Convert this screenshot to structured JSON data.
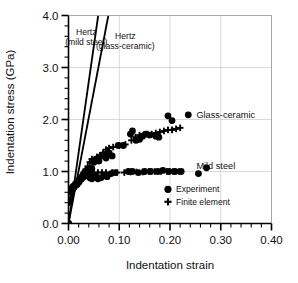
{
  "chart_data": {
    "type": "scatter",
    "title": "",
    "xlabel": "Indentation strain",
    "ylabel": "Indentation stress (GPa)",
    "xlim": [
      0.0,
      0.4
    ],
    "ylim": [
      0.0,
      4.0
    ],
    "xticks": [
      "0.00",
      "0.10",
      "0.20",
      "0.30",
      "0.40"
    ],
    "xtick_values": [
      0.0,
      0.1,
      0.2,
      0.3,
      0.4
    ],
    "yticks": [
      "0.0",
      "1.0",
      "2.0",
      "3.0",
      "4.0"
    ],
    "ytick_values": [
      0.0,
      1.0,
      2.0,
      3.0,
      4.0
    ],
    "x_minor_step": 0.02,
    "y_minor_step": 0.2,
    "grid": true,
    "grid_color": "#c8c8c8",
    "legend_position": "lower-right-inside",
    "legend": [
      {
        "marker": "circle",
        "label": "Experiment"
      },
      {
        "marker": "plus",
        "label": "Finite element"
      }
    ],
    "annotations": [
      {
        "name": "hertz-mild-steel",
        "lines": [
          "Hertz",
          "(mild steel)"
        ],
        "x": 0.035,
        "y": 3.62
      },
      {
        "name": "hertz-glass-ceramic",
        "lines": [
          "Hertz",
          "(glass-ceramic)"
        ],
        "x": 0.112,
        "y": 3.55
      },
      {
        "name": "glass-ceramic-label",
        "lines": [
          "Glass-ceramic"
        ],
        "x": 0.252,
        "y": 2.02
      },
      {
        "name": "mild-steel-label",
        "lines": [
          "Mild steel"
        ],
        "x": 0.252,
        "y": 1.05
      }
    ],
    "reference_lines": [
      {
        "name": "Hertz (mild steel)",
        "x": [
          0.0,
          0.0585
        ],
        "y": [
          0.0,
          4.0
        ],
        "color": "#000000",
        "width": 1.8
      },
      {
        "name": "Hertz (glass-ceramic)",
        "x": [
          0.0,
          0.0785
        ],
        "y": [
          0.0,
          4.0
        ],
        "color": "#000000",
        "width": 1.8
      }
    ],
    "series": [
      {
        "name": "Glass-ceramic Experiment",
        "marker": "circle",
        "color": "#000000",
        "points": [
          [
            0.0,
            0.0
          ],
          [
            0.004,
            0.6
          ],
          [
            0.006,
            0.66
          ],
          [
            0.008,
            0.7
          ],
          [
            0.01,
            0.72
          ],
          [
            0.013,
            0.75
          ],
          [
            0.016,
            0.78
          ],
          [
            0.019,
            0.8
          ],
          [
            0.022,
            0.84
          ],
          [
            0.025,
            0.88
          ],
          [
            0.028,
            0.92
          ],
          [
            0.031,
            0.97
          ],
          [
            0.034,
            1.0
          ],
          [
            0.037,
            1.03
          ],
          [
            0.04,
            1.05
          ],
          [
            0.043,
            1.03
          ],
          [
            0.046,
            1.06
          ],
          [
            0.05,
            1.18
          ],
          [
            0.053,
            1.22
          ],
          [
            0.056,
            1.24
          ],
          [
            0.06,
            1.2
          ],
          [
            0.065,
            1.3
          ],
          [
            0.07,
            1.33
          ],
          [
            0.074,
            1.26
          ],
          [
            0.08,
            1.36
          ],
          [
            0.086,
            1.3
          ],
          [
            0.098,
            1.5
          ],
          [
            0.108,
            1.5
          ],
          [
            0.122,
            1.72
          ],
          [
            0.126,
            1.78
          ],
          [
            0.133,
            1.6
          ],
          [
            0.14,
            1.62
          ],
          [
            0.146,
            1.68
          ],
          [
            0.152,
            1.72
          ],
          [
            0.16,
            1.7
          ],
          [
            0.172,
            1.68
          ],
          [
            0.178,
            1.66
          ],
          [
            0.196,
            2.07
          ],
          [
            0.204,
            1.98
          ],
          [
            0.236,
            2.09
          ]
        ]
      },
      {
        "name": "Glass-ceramic Finite element",
        "marker": "plus",
        "color": "#000000",
        "points": [
          [
            0.002,
            0.4
          ],
          [
            0.004,
            0.5
          ],
          [
            0.007,
            0.62
          ],
          [
            0.01,
            0.68
          ],
          [
            0.014,
            0.74
          ],
          [
            0.018,
            0.79
          ],
          [
            0.022,
            0.86
          ],
          [
            0.026,
            0.92
          ],
          [
            0.03,
            0.98
          ],
          [
            0.034,
            1.04
          ],
          [
            0.038,
            1.1
          ],
          [
            0.042,
            1.18
          ],
          [
            0.046,
            1.24
          ],
          [
            0.05,
            1.22
          ],
          [
            0.056,
            1.28
          ],
          [
            0.062,
            1.31
          ],
          [
            0.068,
            1.36
          ],
          [
            0.074,
            1.42
          ],
          [
            0.08,
            1.45
          ],
          [
            0.088,
            1.47
          ],
          [
            0.1,
            1.5
          ],
          [
            0.112,
            1.52
          ],
          [
            0.124,
            1.6
          ],
          [
            0.132,
            1.66
          ],
          [
            0.14,
            1.7
          ],
          [
            0.148,
            1.7
          ],
          [
            0.156,
            1.72
          ],
          [
            0.164,
            1.72
          ],
          [
            0.172,
            1.74
          ],
          [
            0.18,
            1.76
          ],
          [
            0.188,
            1.78
          ],
          [
            0.196,
            1.8
          ],
          [
            0.204,
            1.8
          ],
          [
            0.212,
            1.82
          ],
          [
            0.22,
            1.84
          ]
        ]
      },
      {
        "name": "Mild steel Experiment",
        "marker": "circle",
        "color": "#000000",
        "points": [
          [
            0.0,
            0.0
          ],
          [
            0.005,
            0.62
          ],
          [
            0.009,
            0.68
          ],
          [
            0.013,
            0.72
          ],
          [
            0.017,
            0.75
          ],
          [
            0.021,
            0.8
          ],
          [
            0.026,
            0.86
          ],
          [
            0.03,
            0.9
          ],
          [
            0.034,
            0.94
          ],
          [
            0.038,
            0.92
          ],
          [
            0.042,
            0.88
          ],
          [
            0.046,
            0.86
          ],
          [
            0.052,
            0.92
          ],
          [
            0.058,
            0.86
          ],
          [
            0.064,
            0.88
          ],
          [
            0.07,
            0.92
          ],
          [
            0.076,
            0.9
          ],
          [
            0.084,
            0.96
          ],
          [
            0.092,
            0.98
          ],
          [
            0.118,
            1.0
          ],
          [
            0.126,
            1.0
          ],
          [
            0.138,
            0.98
          ],
          [
            0.15,
            1.0
          ],
          [
            0.162,
            1.0
          ],
          [
            0.176,
            1.0
          ],
          [
            0.186,
            1.02
          ],
          [
            0.198,
            1.0
          ],
          [
            0.21,
            1.0
          ],
          [
            0.222,
            1.0
          ],
          [
            0.256,
            0.96
          ],
          [
            0.272,
            1.07
          ]
        ]
      },
      {
        "name": "Mild steel Finite element",
        "marker": "plus",
        "color": "#000000",
        "points": [
          [
            0.003,
            0.44
          ],
          [
            0.006,
            0.58
          ],
          [
            0.01,
            0.66
          ],
          [
            0.014,
            0.72
          ],
          [
            0.018,
            0.76
          ],
          [
            0.023,
            0.82
          ],
          [
            0.028,
            0.88
          ],
          [
            0.033,
            0.94
          ],
          [
            0.038,
            0.96
          ],
          [
            0.044,
            0.96
          ],
          [
            0.05,
            0.98
          ],
          [
            0.058,
            0.98
          ],
          [
            0.066,
            0.98
          ],
          [
            0.074,
            0.98
          ],
          [
            0.086,
            0.98
          ],
          [
            0.096,
            0.98
          ],
          [
            0.11,
            0.98
          ],
          [
            0.122,
            0.99
          ],
          [
            0.134,
            0.99
          ],
          [
            0.146,
            0.99
          ],
          [
            0.158,
            1.0
          ],
          [
            0.17,
            1.0
          ],
          [
            0.182,
            1.0
          ],
          [
            0.194,
            1.0
          ],
          [
            0.206,
            1.0
          ],
          [
            0.218,
            1.0
          ]
        ]
      }
    ]
  }
}
